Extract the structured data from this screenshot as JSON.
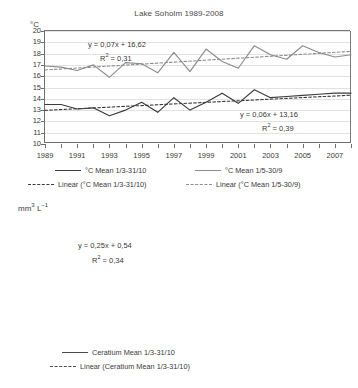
{
  "figure": {
    "panels": [
      "temperature",
      "ceratium"
    ]
  },
  "chart_data": [
    {
      "type": "line",
      "title": "Lake Soholm 1989-2008",
      "xlabel": "",
      "ylabel": "°C",
      "ylim": [
        10,
        20
      ],
      "xlim": [
        1989,
        2008
      ],
      "grid": true,
      "legend_position": "below",
      "yticks": [
        10,
        11,
        12,
        13,
        14,
        15,
        16,
        17,
        18,
        19,
        20
      ],
      "xticks": [
        1989,
        1991,
        1993,
        1995,
        1997,
        1999,
        2001,
        2003,
        2005,
        2007
      ],
      "x": [
        1989,
        1990,
        1991,
        1992,
        1993,
        1994,
        1995,
        1996,
        1997,
        1998,
        1999,
        2000,
        2001,
        2002,
        2003,
        2004,
        2005,
        2006,
        2007,
        2008
      ],
      "annotations": [
        {
          "text": "y = 0,07x + 16,62",
          "series": "°C Mean 1/5-30/9"
        },
        {
          "text": "R² = 0,31",
          "series": "°C Mean 1/5-30/9"
        },
        {
          "text": "y = 0,06x + 13,16",
          "series": "°C Mean 1/3-31/10"
        },
        {
          "text": "R² = 0,39",
          "series": "°C Mean 1/3-31/10"
        }
      ],
      "series": [
        {
          "name": "°C Mean 1/3-31/10",
          "style": "solid",
          "color": "#3c3c3c",
          "values": [
            13.5,
            13.5,
            13.1,
            13.2,
            12.5,
            13.0,
            13.7,
            12.8,
            14.1,
            13.0,
            13.7,
            14.5,
            13.6,
            14.8,
            14.1,
            14.2,
            14.3,
            14.4,
            14.5,
            14.5
          ]
        },
        {
          "name": "°C Mean 1/5-30/9",
          "style": "solid",
          "color": "#8c8c8c",
          "values": [
            16.9,
            16.8,
            16.5,
            17.0,
            15.9,
            17.2,
            17.1,
            16.3,
            18.1,
            16.4,
            18.4,
            17.3,
            16.7,
            18.7,
            17.9,
            17.5,
            18.7,
            18.1,
            17.7,
            17.9
          ]
        },
        {
          "name": "Linear (°C Mean 1/3-31/10)",
          "style": "dashed",
          "color": "#3c3c3c",
          "equation": "y = 0,06x + 13,16",
          "r2": "R² = 0,39",
          "slope": 0.06,
          "intercept": 13.16,
          "endpoints": [
            12.98,
            14.32
          ]
        },
        {
          "name": "Linear (°C Mean 1/5-30/9)",
          "style": "dashed",
          "color": "#8c8c8c",
          "equation": "y = 0,07x + 16,62",
          "r2": "R² = 0,31",
          "slope": 0.07,
          "intercept": 16.62,
          "endpoints": [
            16.55,
            18.2
          ]
        }
      ]
    },
    {
      "type": "line",
      "title": "",
      "xlabel": "",
      "ylabel": "mm³ L⁻¹",
      "ylim": [
        0,
        40
      ],
      "xlim": [
        1989,
        2008
      ],
      "grid": true,
      "legend_position": "below",
      "yticks": [
        0,
        5,
        10,
        15,
        20,
        25,
        30,
        35,
        40
      ],
      "xticks": [
        1989,
        1991,
        1993,
        1995,
        1997,
        1999,
        2001,
        2003,
        2005,
        2007
      ],
      "x": [
        1989,
        1990,
        1991,
        1992,
        1993,
        1994,
        1995,
        1996,
        1997,
        1998,
        1999,
        2000,
        2001,
        2002,
        2003,
        2004,
        2005,
        2006,
        2007,
        2008
      ],
      "annotations": [
        {
          "text": "y = 0,25x + 0,54",
          "series": "Ceratium Mean 1/3-31/10"
        },
        {
          "text": "R² = 0,34",
          "series": "Ceratium Mean 1/3-31/10"
        }
      ],
      "series": [
        {
          "name": "Ceratium Mean 1/3-31/10",
          "style": "solid",
          "color": "#4a4a4a",
          "values": [
            1.2,
            4.3,
            5.3,
            3.4,
            14.9,
            4.0,
            1.0,
            5.8,
            1.2,
            2.8,
            11.6,
            4.7,
            4.8,
            5.9,
            5.7,
            10.5,
            19.2,
            4.6,
            36.4,
            32.3
          ]
        },
        {
          "name": "Linear (Ceratium Mean 1/3-31/10)",
          "style": "dashed",
          "color": "#4a4a4a",
          "equation": "y = 0,25x + 0,54",
          "r2": "R² = 0,34",
          "slope": 0.25,
          "intercept": 0.54,
          "endpoints": [
            0.1,
            18.2
          ]
        }
      ]
    }
  ],
  "top_panel": {
    "title": "Lake Soholm 1989-2008",
    "unit": "°C",
    "equation_upper": "y = 0,07x + 16,62",
    "r2_upper": "R",
    "r2_upper_sup": "2",
    "r2_upper_val": " = 0,31",
    "equation_lower": "y = 0,06x + 13,16",
    "r2_lower": "R",
    "r2_lower_sup": "2",
    "r2_lower_val": " = 0,39",
    "legend": [
      {
        "label_pre": "°C Mean 1/3-31/10",
        "style": "solid",
        "color": "#3c3c3c"
      },
      {
        "label_pre": "°C Mean 1/5-30/9",
        "style": "solid",
        "color": "#8c8c8c"
      },
      {
        "label_pre": "Linear (°C Mean 1/3-31/10)",
        "style": "dashed",
        "color": "#3c3c3c"
      },
      {
        "label_pre": "Linear (°C Mean 1/5-30/9)",
        "style": "dashed",
        "color": "#8c8c8c"
      }
    ]
  },
  "bottom_panel": {
    "unit_main": "mm",
    "unit_sup1": "3",
    "unit_mid": " L",
    "unit_sup2": "−1",
    "equation": "y = 0,25x + 0,54",
    "r2": "R",
    "r2_sup": "2",
    "r2_val": " = 0,34",
    "legend": [
      {
        "label_pre": "Ceratium Mean 1/3-31/10",
        "style": "solid",
        "color": "#4a4a4a"
      },
      {
        "label_pre": "Linear (Ceratium Mean 1/3-31/10)",
        "style": "dashed",
        "color": "#4a4a4a"
      }
    ]
  }
}
